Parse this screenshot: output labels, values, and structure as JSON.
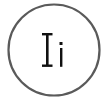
{
  "icon": {
    "name": "text-case-icon",
    "label": "Ii",
    "upper": "I",
    "lower": "i",
    "stroke_color": "#555555",
    "text_color": "#111111",
    "background": "#ffffff"
  }
}
